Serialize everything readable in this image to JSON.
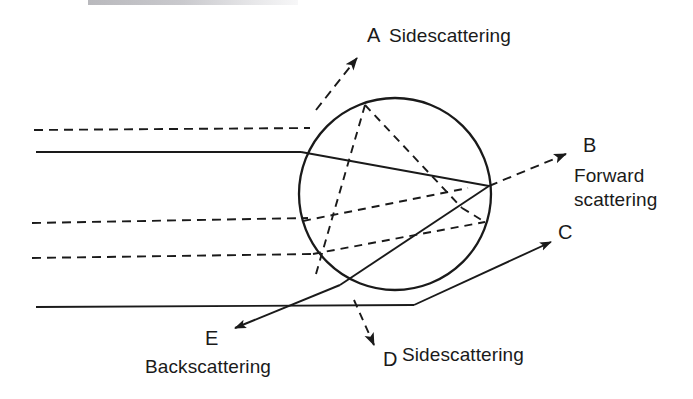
{
  "figure": {
    "background_color": "#ffffff",
    "stroke_color": "#1a1a1a",
    "width": 693,
    "height": 399
  },
  "labels": {
    "a_letter": "A",
    "a_text": "Sidescattering",
    "b_letter": "B",
    "b_text_line1": "Forward",
    "b_text_line2": "scattering",
    "c_letter": "C",
    "d_letter": "D",
    "d_text": "Sidescattering",
    "e_letter": "E",
    "e_text": "Backscattering"
  },
  "geometry": {
    "circle": {
      "cx": 395,
      "cy": 194,
      "r": 96
    },
    "incident_rays": [
      {
        "name": "dashed-ray-1",
        "style": "dashed",
        "x1": 34,
        "y1": 130,
        "x2": 310,
        "y2": 128
      },
      {
        "name": "solid-ray-1",
        "style": "solid",
        "x1": 36,
        "y1": 152,
        "x2": 300,
        "y2": 152
      },
      {
        "name": "dashed-ray-2",
        "style": "dashed",
        "x1": 32,
        "y1": 223,
        "x2": 306,
        "y2": 218
      },
      {
        "name": "dashed-ray-3",
        "style": "dashed",
        "x1": 32,
        "y1": 258,
        "x2": 312,
        "y2": 254
      },
      {
        "name": "solid-ray-2",
        "style": "solid",
        "x1": 36,
        "y1": 307,
        "x2": 415,
        "y2": 305
      }
    ],
    "scattered_rays": [
      {
        "name": "ray-a-sidescattering",
        "style": "dashed",
        "letter": "A",
        "tip_x": 355,
        "tip_y": 55
      },
      {
        "name": "ray-b-forward-scattering",
        "style": "dashed",
        "letter": "B",
        "tip_x": 568,
        "tip_y": 152
      },
      {
        "name": "ray-c",
        "style": "solid",
        "letter": "C",
        "tip_x": 553,
        "tip_y": 240
      },
      {
        "name": "ray-d-sidescattering",
        "style": "dashed",
        "letter": "D",
        "tip_x": 375,
        "tip_y": 348
      },
      {
        "name": "ray-e-backscattering",
        "style": "solid",
        "letter": "E",
        "tip_x": 232,
        "tip_y": 330
      }
    ]
  }
}
